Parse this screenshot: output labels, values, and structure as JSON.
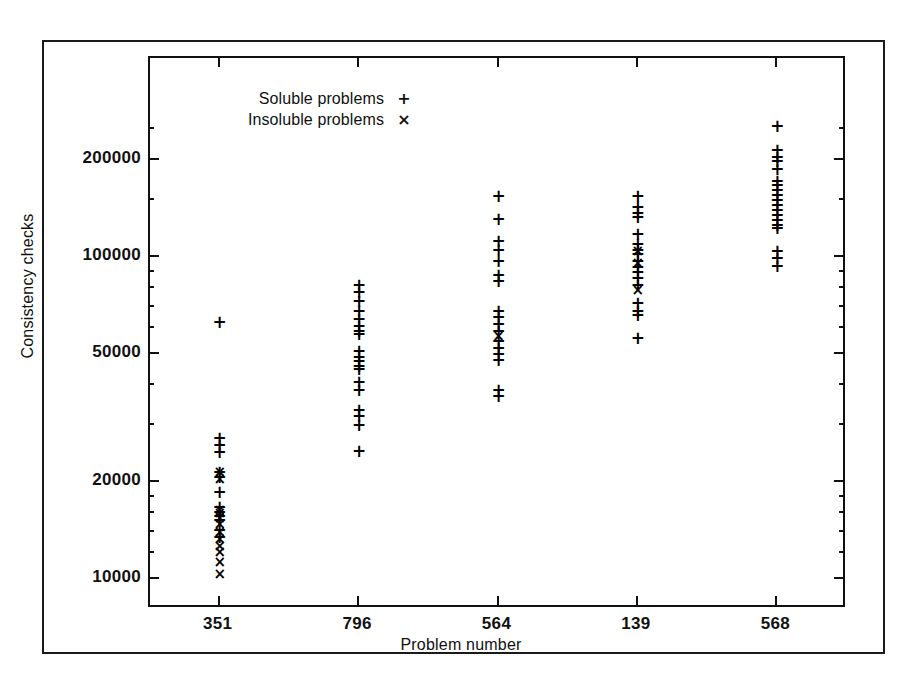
{
  "chart_data": {
    "type": "scatter",
    "title": "",
    "xlabel": "Problem number",
    "ylabel": "Consistency checks",
    "yscale": "log",
    "ylim": [
      8500,
      270000
    ],
    "yticks": [
      10000,
      20000,
      50000,
      100000,
      200000
    ],
    "ytick_labels": [
      "10000",
      "20000",
      "50000",
      "100000",
      "200000"
    ],
    "categories": [
      "351",
      "796",
      "564",
      "139",
      "568"
    ],
    "grid": false,
    "legend_position": "top-left-inside",
    "legend": [
      {
        "name": "Soluble problems",
        "marker": "+"
      },
      {
        "name": "Insoluble problems",
        "marker": "x"
      }
    ],
    "series": [
      {
        "name": "Soluble problems",
        "marker": "+",
        "points": [
          {
            "x": "351",
            "y": 63000
          },
          {
            "x": "351",
            "y": 27500
          },
          {
            "x": "351",
            "y": 26000
          },
          {
            "x": "351",
            "y": 24800
          },
          {
            "x": "351",
            "y": 21500
          },
          {
            "x": "351",
            "y": 20800
          },
          {
            "x": "351",
            "y": 18600
          },
          {
            "x": "351",
            "y": 16700
          },
          {
            "x": "351",
            "y": 16200
          },
          {
            "x": "351",
            "y": 15700
          },
          {
            "x": "351",
            "y": 15300
          },
          {
            "x": "351",
            "y": 14200
          },
          {
            "x": "351",
            "y": 13500
          },
          {
            "x": "796",
            "y": 82000
          },
          {
            "x": "796",
            "y": 78000
          },
          {
            "x": "796",
            "y": 73000
          },
          {
            "x": "796",
            "y": 68000
          },
          {
            "x": "796",
            "y": 64000
          },
          {
            "x": "796",
            "y": 61000
          },
          {
            "x": "796",
            "y": 59000
          },
          {
            "x": "796",
            "y": 57500
          },
          {
            "x": "796",
            "y": 51000
          },
          {
            "x": "796",
            "y": 49000
          },
          {
            "x": "796",
            "y": 47500
          },
          {
            "x": "796",
            "y": 46000
          },
          {
            "x": "796",
            "y": 45000
          },
          {
            "x": "796",
            "y": 41000
          },
          {
            "x": "796",
            "y": 38500
          },
          {
            "x": "796",
            "y": 33500
          },
          {
            "x": "796",
            "y": 32000
          },
          {
            "x": "796",
            "y": 30000
          },
          {
            "x": "796",
            "y": 25000
          },
          {
            "x": "564",
            "y": 155000
          },
          {
            "x": "564",
            "y": 131000
          },
          {
            "x": "564",
            "y": 112000
          },
          {
            "x": "564",
            "y": 105000
          },
          {
            "x": "564",
            "y": 97000
          },
          {
            "x": "564",
            "y": 88000
          },
          {
            "x": "564",
            "y": 84000
          },
          {
            "x": "564",
            "y": 68000
          },
          {
            "x": "564",
            "y": 65000
          },
          {
            "x": "564",
            "y": 62000
          },
          {
            "x": "564",
            "y": 59000
          },
          {
            "x": "564",
            "y": 55000
          },
          {
            "x": "564",
            "y": 52000
          },
          {
            "x": "564",
            "y": 50000
          },
          {
            "x": "564",
            "y": 48000
          },
          {
            "x": "564",
            "y": 38500
          },
          {
            "x": "564",
            "y": 37000
          },
          {
            "x": "139",
            "y": 155000
          },
          {
            "x": "139",
            "y": 143000
          },
          {
            "x": "139",
            "y": 137000
          },
          {
            "x": "139",
            "y": 133000
          },
          {
            "x": "139",
            "y": 118000
          },
          {
            "x": "139",
            "y": 110000
          },
          {
            "x": "139",
            "y": 105000
          },
          {
            "x": "139",
            "y": 102000
          },
          {
            "x": "139",
            "y": 97000
          },
          {
            "x": "139",
            "y": 93000
          },
          {
            "x": "139",
            "y": 90000
          },
          {
            "x": "139",
            "y": 86000
          },
          {
            "x": "139",
            "y": 82000
          },
          {
            "x": "139",
            "y": 72000
          },
          {
            "x": "139",
            "y": 68000
          },
          {
            "x": "139",
            "y": 66000
          },
          {
            "x": "139",
            "y": 56000
          },
          {
            "x": "568",
            "y": 255000
          },
          {
            "x": "568",
            "y": 215000
          },
          {
            "x": "568",
            "y": 205000
          },
          {
            "x": "568",
            "y": 198000
          },
          {
            "x": "568",
            "y": 188000
          },
          {
            "x": "568",
            "y": 172000
          },
          {
            "x": "568",
            "y": 167000
          },
          {
            "x": "568",
            "y": 161000
          },
          {
            "x": "568",
            "y": 156000
          },
          {
            "x": "568",
            "y": 150000
          },
          {
            "x": "568",
            "y": 145000
          },
          {
            "x": "568",
            "y": 140000
          },
          {
            "x": "568",
            "y": 135000
          },
          {
            "x": "568",
            "y": 130000
          },
          {
            "x": "568",
            "y": 126000
          },
          {
            "x": "568",
            "y": 123000
          },
          {
            "x": "568",
            "y": 104000
          },
          {
            "x": "568",
            "y": 99000
          },
          {
            "x": "568",
            "y": 94000
          }
        ]
      },
      {
        "name": "Insoluble problems",
        "marker": "x",
        "points": [
          {
            "x": "351",
            "y": 21500
          },
          {
            "x": "351",
            "y": 20500
          },
          {
            "x": "351",
            "y": 16400
          },
          {
            "x": "351",
            "y": 16000
          },
          {
            "x": "351",
            "y": 15500
          },
          {
            "x": "351",
            "y": 14800
          },
          {
            "x": "351",
            "y": 14000
          },
          {
            "x": "351",
            "y": 13300
          },
          {
            "x": "351",
            "y": 12700
          },
          {
            "x": "351",
            "y": 12100
          },
          {
            "x": "351",
            "y": 11300
          },
          {
            "x": "351",
            "y": 10400
          },
          {
            "x": "564",
            "y": 57000
          },
          {
            "x": "139",
            "y": 104000
          },
          {
            "x": "139",
            "y": 96000
          },
          {
            "x": "139",
            "y": 79000
          }
        ]
      }
    ]
  },
  "legend": {
    "soluble_label": "Soluble problems",
    "soluble_symbol": "+",
    "insoluble_label": "Insoluble problems",
    "insoluble_symbol": "×"
  },
  "axes": {
    "x_title": "Problem number",
    "y_title": "Consistency checks",
    "x_ticks": [
      "351",
      "796",
      "564",
      "139",
      "568"
    ],
    "y_ticks": [
      "10000",
      "20000",
      "50000",
      "100000",
      "200000"
    ]
  },
  "colors": {
    "ink": "#111111",
    "background": "#ffffff"
  }
}
